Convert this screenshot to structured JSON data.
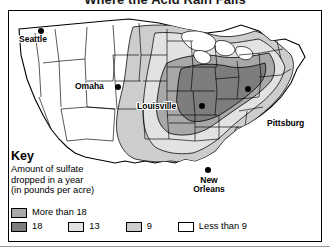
{
  "title": "Where the Acid Rain Falls",
  "key": {
    "heading": "Key",
    "description_line1": "Amount of sulfate",
    "description_line2": "dropped in a year",
    "description_line3": "(in pounds per acre)"
  },
  "legend": {
    "items": [
      {
        "label": "More than 18",
        "color": "#a8a8a8",
        "value": "more than 18"
      },
      {
        "label": "18",
        "color": "#7d7d7d",
        "value": "18"
      },
      {
        "label": "13",
        "color": "#e2e2e2",
        "value": "13"
      },
      {
        "label": "9",
        "color": "#cdcdcd",
        "value": "9"
      },
      {
        "label": "Less than 9",
        "color": "#ffffff",
        "value": "less than 9"
      }
    ]
  },
  "cities": [
    {
      "name": "Seattle",
      "label": "Seattle"
    },
    {
      "name": "Omaha",
      "label": "Omaha"
    },
    {
      "name": "Louisville",
      "label": "Louisville"
    },
    {
      "name": "Pittsburg",
      "label": "Pittsburg"
    },
    {
      "name": "New Orleans",
      "label_line1": "New",
      "label_line2": "Orleans"
    }
  ],
  "map_data": {
    "type": "choropleth-contour",
    "region": "Contiguous United States",
    "measure": "sulfate deposition",
    "unit": "pounds per acre per year",
    "bands": [
      "more than 18",
      "18",
      "13",
      "9",
      "less than 9"
    ],
    "highest_concentration": "Ohio Valley and Northeast",
    "lowest_concentration": "Western United States"
  }
}
